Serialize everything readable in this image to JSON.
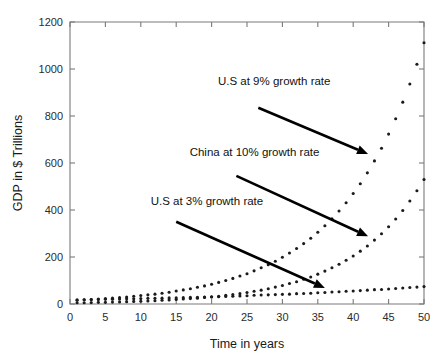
{
  "chart_data": {
    "type": "scatter",
    "title": "",
    "xlabel": "Time in years",
    "ylabel": "GDP in $ Trillions",
    "xlim": [
      0,
      50
    ],
    "ylim": [
      0,
      1200
    ],
    "xticks": [
      0,
      5,
      10,
      15,
      20,
      25,
      30,
      35,
      40,
      45,
      50
    ],
    "yticks": [
      0,
      200,
      400,
      600,
      800,
      1000,
      1200
    ],
    "xtick_labels": [
      "0",
      "5",
      "10",
      "15",
      "20",
      "25",
      "30",
      "35",
      "40",
      "45",
      "50"
    ],
    "ytick_labels": [
      "0",
      "200",
      "400",
      "600",
      "800",
      "1000",
      "1200"
    ],
    "grid": false,
    "legend_position": "none",
    "marker": "dot",
    "marker_color": "#1b1b1b",
    "series": [
      {
        "name": "U.S at 9% growth rate",
        "growth_rate_percent": 9,
        "initial_value": 15,
        "x": [
          1,
          2,
          3,
          4,
          5,
          6,
          7,
          8,
          9,
          10,
          11,
          12,
          13,
          14,
          15,
          16,
          17,
          18,
          19,
          20,
          21,
          22,
          23,
          24,
          25,
          26,
          27,
          28,
          29,
          30,
          31,
          32,
          33,
          34,
          35,
          36,
          37,
          38,
          39,
          40,
          41,
          42,
          43,
          44,
          45,
          46,
          47,
          48,
          49,
          50
        ],
        "values": [
          16,
          18,
          19,
          21,
          23,
          25,
          27,
          30,
          33,
          36,
          39,
          42,
          46,
          50,
          55,
          60,
          65,
          71,
          77,
          84,
          92,
          100,
          109,
          119,
          129,
          141,
          154,
          167,
          182,
          199,
          217,
          236,
          257,
          280,
          305,
          333,
          363,
          396,
          431,
          470,
          512,
          558,
          609,
          663,
          723,
          788,
          859,
          936,
          1020,
          1112
        ]
      },
      {
        "name": "China at 10% growth rate",
        "growth_rate_percent": 10,
        "initial_value": 4.5,
        "x": [
          1,
          2,
          3,
          4,
          5,
          6,
          7,
          8,
          9,
          10,
          11,
          12,
          13,
          14,
          15,
          16,
          17,
          18,
          19,
          20,
          21,
          22,
          23,
          24,
          25,
          26,
          27,
          28,
          29,
          30,
          31,
          32,
          33,
          34,
          35,
          36,
          37,
          38,
          39,
          40,
          41,
          42,
          43,
          44,
          45,
          46,
          47,
          48,
          49,
          50
        ],
        "values": [
          5,
          5,
          6,
          7,
          7,
          8,
          9,
          10,
          11,
          12,
          13,
          14,
          16,
          17,
          19,
          21,
          23,
          25,
          28,
          30,
          33,
          37,
          40,
          44,
          49,
          54,
          59,
          65,
          72,
          79,
          87,
          95,
          105,
          115,
          127,
          140,
          154,
          169,
          186,
          204,
          225,
          247,
          272,
          299,
          329,
          362,
          398,
          438,
          482,
          530
        ]
      },
      {
        "name": "U.S at 3% growth rate",
        "growth_rate_percent": 3,
        "initial_value": 17,
        "x": [
          1,
          2,
          3,
          4,
          5,
          6,
          7,
          8,
          9,
          10,
          11,
          12,
          13,
          14,
          15,
          16,
          17,
          18,
          19,
          20,
          21,
          22,
          23,
          24,
          25,
          26,
          27,
          28,
          29,
          30,
          31,
          32,
          33,
          34,
          35,
          36,
          37,
          38,
          39,
          40,
          41,
          42,
          43,
          44,
          45,
          46,
          47,
          48,
          49,
          50
        ],
        "values": [
          18,
          18,
          19,
          19,
          20,
          20,
          21,
          22,
          22,
          23,
          24,
          24,
          25,
          26,
          26,
          27,
          28,
          29,
          30,
          31,
          31,
          32,
          33,
          34,
          35,
          37,
          38,
          39,
          40,
          41,
          42,
          44,
          45,
          46,
          48,
          49,
          51,
          52,
          54,
          55,
          57,
          59,
          61,
          62,
          64,
          66,
          68,
          70,
          72,
          74
        ]
      }
    ],
    "annotations": [
      {
        "id": "annot-us-9",
        "text": "U.S at 9% growth rate",
        "text_x": 20.9,
        "text_y": 930,
        "arrow_from_x": 26.6,
        "arrow_from_y": 835,
        "arrow_to_x": 42.1,
        "arrow_to_y": 638
      },
      {
        "id": "annot-china-10",
        "text": "China at 10% growth rate",
        "text_x": 16.9,
        "text_y": 630,
        "arrow_from_x": 23.5,
        "arrow_from_y": 545,
        "arrow_to_x": 42.1,
        "arrow_to_y": 288
      },
      {
        "id": "annot-us-3",
        "text": "U.S at 3% growth rate",
        "text_x": 11.4,
        "text_y": 420,
        "arrow_from_x": 15.0,
        "arrow_from_y": 350,
        "arrow_to_x": 36.0,
        "arrow_to_y": 68
      }
    ]
  }
}
